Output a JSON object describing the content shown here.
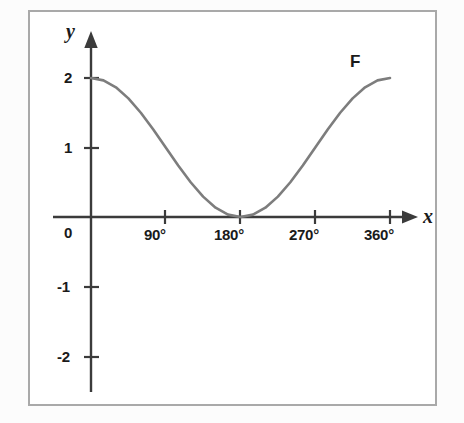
{
  "chart_data": {
    "type": "line",
    "title": "",
    "xlabel": "x",
    "ylabel": "y",
    "curve_label": "F",
    "function": "y = 1 + cos(x)",
    "xlim": [
      -30,
      400
    ],
    "ylim": [
      -2.6,
      2.45
    ],
    "grid": false,
    "legend_position": "none",
    "x_tick_labels": [
      "0",
      "90°",
      "180°",
      "270°",
      "360°"
    ],
    "x_tick_values": [
      0,
      90,
      180,
      270,
      360
    ],
    "y_tick_labels": [
      "2",
      "1",
      "-1",
      "-2"
    ],
    "y_tick_values": [
      2,
      1,
      -1,
      -2
    ],
    "x": [
      0,
      15,
      30,
      45,
      60,
      75,
      90,
      105,
      120,
      135,
      150,
      165,
      180,
      195,
      210,
      225,
      240,
      255,
      270,
      285,
      300,
      315,
      330,
      345,
      360
    ],
    "values": [
      2,
      1.966,
      1.866,
      1.707,
      1.5,
      1.259,
      1,
      0.741,
      0.5,
      0.293,
      0.134,
      0.034,
      0,
      0.034,
      0.134,
      0.293,
      0.5,
      0.741,
      1,
      1.259,
      1.5,
      1.707,
      1.866,
      1.966,
      2
    ],
    "series": [
      {
        "name": "F",
        "values": [
          2,
          1.966,
          1.866,
          1.707,
          1.5,
          1.259,
          1,
          0.741,
          0.5,
          0.293,
          0.134,
          0.034,
          0,
          0.034,
          0.134,
          0.293,
          0.5,
          0.741,
          1,
          1.259,
          1.5,
          1.707,
          1.866,
          1.966,
          2
        ]
      }
    ],
    "colors": {
      "curve": "#7d7d7d",
      "axis": "#3b3b3b",
      "frame": "#a9a9a9",
      "background": "#ffffff",
      "text": "#1a1a1a"
    }
  },
  "labels": {
    "x_axis": "x",
    "y_axis": "y",
    "curve": "F",
    "x_0": "0",
    "x_90": "90°",
    "x_180": "180°",
    "x_270": "270°",
    "x_360": "360°",
    "y_2": "2",
    "y_1": "1",
    "y_neg1": "-1",
    "y_neg2": "-2"
  }
}
